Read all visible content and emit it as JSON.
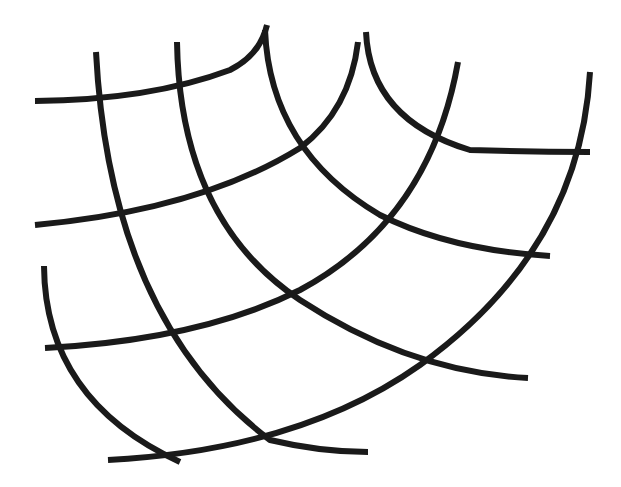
{
  "figure": {
    "title": "",
    "stroke_color": "#1a1a1a",
    "background": "#ffffff",
    "stroke_width": 6,
    "horizontal_arcs": [
      {
        "id": "h1",
        "d": "M35,101 Q150,100 230,70 Q260,55 267,25"
      },
      {
        "id": "h2",
        "d": "M35,225 Q200,210 300,148 Q350,110 358,42"
      },
      {
        "id": "h3",
        "d": "M45,348 Q200,340 300,290 Q430,220 458,62"
      },
      {
        "id": "h4",
        "d": "M108,460 Q300,450 420,365 Q580,250 590,72"
      }
    ],
    "vertical_arcs": [
      {
        "id": "v1",
        "d": "M44,266 Q45,400 180,462"
      },
      {
        "id": "v2",
        "d": "M96,52 Q110,320 270,440 Q320,452 368,452"
      },
      {
        "id": "v3",
        "d": "M177,42 Q180,220 300,300 Q410,372 528,378"
      },
      {
        "id": "v4",
        "d": "M265,30 Q270,150 380,215 Q450,250 550,256"
      },
      {
        "id": "v5",
        "d": "M366,32 Q370,120 470,150 Q530,152 590,152"
      }
    ]
  }
}
